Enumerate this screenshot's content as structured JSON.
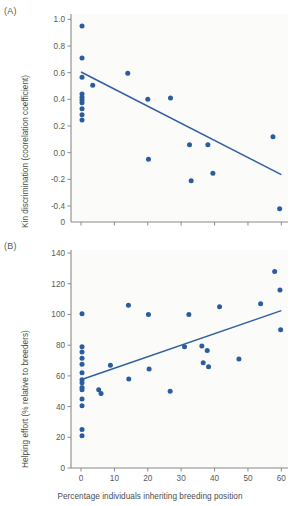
{
  "figure": {
    "panelA_tag": "(A)",
    "panelB_tag": "(B)",
    "xlabel": "Percentage individuals inheriting breeding position"
  },
  "chart_data": [
    {
      "type": "scatter",
      "panel": "(A)",
      "title": "",
      "xlabel": "Percentage individuals inheriting breeding position",
      "ylabel": "Kin discrimination (coorelation coefficient)",
      "xlim": [
        -3,
        62
      ],
      "ylim": [
        -0.52,
        1.04
      ],
      "xticks": [
        0,
        10,
        20,
        30,
        40,
        50,
        60
      ],
      "xticklabels": [
        "0",
        "10",
        "20",
        "30",
        "40",
        "50",
        "60"
      ],
      "yticks": [
        -0.4,
        -0.2,
        0.0,
        0.2,
        0.4,
        0.6,
        0.8,
        1.0
      ],
      "yticklabels": [
        "-0.4",
        "-0.2",
        "0.0",
        "0.2",
        "0.4",
        "0.6",
        "0.8",
        "1.0"
      ],
      "origin_label": "0",
      "grid": false,
      "legend": "none",
      "marker_color": "#2a5d9e",
      "line_color": "#2f5f9e",
      "points": [
        {
          "x": 0.3,
          "y": 0.95
        },
        {
          "x": 0.3,
          "y": 0.71
        },
        {
          "x": 0.3,
          "y": 0.565
        },
        {
          "x": 0.3,
          "y": 0.44
        },
        {
          "x": 0.3,
          "y": 0.415
        },
        {
          "x": 0.3,
          "y": 0.395
        },
        {
          "x": 0.3,
          "y": 0.375
        },
        {
          "x": 0.3,
          "y": 0.33
        },
        {
          "x": 0.3,
          "y": 0.285
        },
        {
          "x": 0.3,
          "y": 0.245
        },
        {
          "x": 3.5,
          "y": 0.505
        },
        {
          "x": 14.0,
          "y": 0.595
        },
        {
          "x": 20.0,
          "y": 0.4
        },
        {
          "x": 20.2,
          "y": -0.05
        },
        {
          "x": 26.8,
          "y": 0.41
        },
        {
          "x": 32.5,
          "y": 0.06
        },
        {
          "x": 33.0,
          "y": -0.21
        },
        {
          "x": 38.0,
          "y": 0.06
        },
        {
          "x": 39.5,
          "y": -0.155
        },
        {
          "x": 57.5,
          "y": 0.12
        },
        {
          "x": 59.5,
          "y": -0.42
        }
      ],
      "fit_line": {
        "x1": 0.0,
        "y1": 0.605,
        "x2": 60.0,
        "y2": -0.165
      }
    },
    {
      "type": "scatter",
      "panel": "(B)",
      "title": "",
      "xlabel": "Percentage individuals inheriting breeding position",
      "ylabel": "Helping effort (% relative to breeders)",
      "xlim": [
        -3,
        62
      ],
      "ylim": [
        0,
        142
      ],
      "xticks": [
        0,
        10,
        20,
        30,
        40,
        50,
        60
      ],
      "xticklabels": [
        "0",
        "10",
        "20",
        "30",
        "40",
        "50",
        "60"
      ],
      "yticks": [
        0,
        20,
        40,
        60,
        80,
        100,
        120,
        140
      ],
      "yticklabels": [
        "0",
        "20",
        "40",
        "60",
        "80",
        "100",
        "120",
        "140"
      ],
      "grid": false,
      "legend": "none",
      "marker_color": "#2a5d9e",
      "line_color": "#2f5f9e",
      "points": [
        {
          "x": 0.3,
          "y": 100.5
        },
        {
          "x": 0.3,
          "y": 79.0
        },
        {
          "x": 0.3,
          "y": 75.5
        },
        {
          "x": 0.3,
          "y": 71.5
        },
        {
          "x": 0.3,
          "y": 67.5
        },
        {
          "x": 0.3,
          "y": 62.0
        },
        {
          "x": 0.3,
          "y": 57.5
        },
        {
          "x": 0.3,
          "y": 55.5
        },
        {
          "x": 0.3,
          "y": 52.5
        },
        {
          "x": 0.3,
          "y": 51.0
        },
        {
          "x": 0.3,
          "y": 45.0
        },
        {
          "x": 0.3,
          "y": 40.5
        },
        {
          "x": 0.3,
          "y": 25.0
        },
        {
          "x": 0.3,
          "y": 21.0
        },
        {
          "x": 5.3,
          "y": 51.0
        },
        {
          "x": 6.0,
          "y": 48.5
        },
        {
          "x": 8.8,
          "y": 67.0
        },
        {
          "x": 14.2,
          "y": 106.0
        },
        {
          "x": 14.3,
          "y": 58.0
        },
        {
          "x": 20.2,
          "y": 100.0
        },
        {
          "x": 20.4,
          "y": 64.5
        },
        {
          "x": 26.7,
          "y": 50.0
        },
        {
          "x": 31.0,
          "y": 79.0
        },
        {
          "x": 32.3,
          "y": 100.0
        },
        {
          "x": 36.2,
          "y": 79.5
        },
        {
          "x": 36.6,
          "y": 68.5
        },
        {
          "x": 37.8,
          "y": 76.5
        },
        {
          "x": 38.2,
          "y": 66.0
        },
        {
          "x": 41.5,
          "y": 105.0
        },
        {
          "x": 47.3,
          "y": 71.0
        },
        {
          "x": 53.8,
          "y": 107.0
        },
        {
          "x": 58.0,
          "y": 128.0
        },
        {
          "x": 59.6,
          "y": 116.0
        },
        {
          "x": 59.8,
          "y": 90.0
        }
      ],
      "fit_line": {
        "x1": 0.0,
        "y1": 57.5,
        "x2": 60.0,
        "y2": 102.5
      }
    }
  ]
}
